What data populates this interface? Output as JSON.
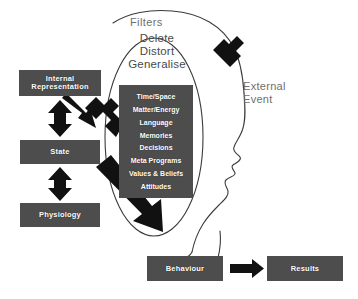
{
  "diagram": {
    "head_label": "head-profile-outline",
    "colors": {
      "box_fill": "#4d4d4d",
      "box_text": "#ffffff",
      "outline": "#3a3a3a",
      "label_text": "#6f6f6f",
      "arrow_fill": "#1a1a1a",
      "background": "#ffffff"
    }
  },
  "labels": {
    "filters": "Filters",
    "external_event_line1": "External",
    "external_event_line2": "Event"
  },
  "distortions": {
    "items": [
      "Delete",
      "Distort",
      "Generalise"
    ]
  },
  "filters_box": {
    "items": [
      "Time/Space",
      "Matter/Energy",
      "Language",
      "Memories",
      "Decisions",
      "Meta Programs",
      "Values & Beliefs",
      "Attitudes"
    ]
  },
  "boxes": {
    "internal_representation": "Internal\nRepresentation",
    "internal_representation_line1": "Internal",
    "internal_representation_line2": "Representation",
    "state": "State",
    "physiology": "Physiology",
    "behaviour": "Behaviour",
    "results": "Results"
  },
  "arrows": [
    {
      "name": "external-event-inbound-arrow",
      "from": "External Event",
      "to": "Filters"
    },
    {
      "name": "filters-to-internal-representation-arrow",
      "from": "Filters",
      "to": "Internal Representation"
    },
    {
      "name": "internal-representation-state-double-arrow",
      "from": "Internal Representation",
      "to": "State",
      "bidirectional": true
    },
    {
      "name": "state-physiology-double-arrow",
      "from": "State",
      "to": "Physiology",
      "bidirectional": true
    },
    {
      "name": "filters-to-behaviour-arrow",
      "from": "Filters",
      "to": "Behaviour"
    },
    {
      "name": "behaviour-to-results-arrow",
      "from": "Behaviour",
      "to": "Results"
    }
  ]
}
